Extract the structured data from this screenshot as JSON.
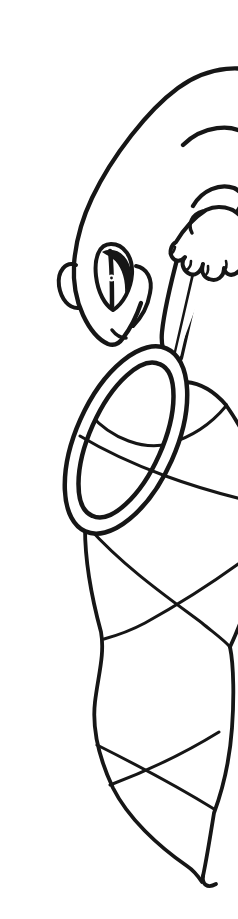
{
  "illustration": {
    "subject": "Gecko leaning from the page edge holding a butterfly net",
    "style": "black-outline coloring-book line art on white",
    "elements": [
      "page-border-line",
      "gecko-back-curve",
      "gecko-head",
      "gecko-ear-bump",
      "gecko-eye-slit-pupil",
      "gecko-mouth",
      "gecko-cheek-curve",
      "gecko-arm",
      "gecko-hand-gripping-handle",
      "net-handle-rod",
      "net-hoop-ring",
      "net-mesh-bag"
    ],
    "colors": {
      "ink": "#161616",
      "background": "#ffffff"
    }
  },
  "accessibility": {
    "alt": "Black and white line drawing of a gecko peeking over the right page border, gripping the long handle of a butterfly net; the net has a large tilted oval hoop and a long tapering bag crossed by curved mesh lines."
  }
}
